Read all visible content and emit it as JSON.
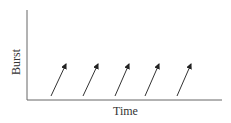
{
  "chart_data": {
    "type": "diagram",
    "title": "",
    "xlabel": "Time",
    "ylabel": "Burst",
    "grid": false,
    "elements": "Five identical upward-slanting arrows evenly spaced along the time axis, representing periodic bursts",
    "arrows": [
      {
        "x1": 51,
        "y1": 96,
        "x2": 66,
        "y2": 64
      },
      {
        "x1": 83,
        "y1": 96,
        "x2": 98,
        "y2": 64
      },
      {
        "x1": 115,
        "y1": 96,
        "x2": 129,
        "y2": 64
      },
      {
        "x1": 145,
        "y1": 96,
        "x2": 159,
        "y2": 64
      },
      {
        "x1": 177,
        "y1": 96,
        "x2": 191,
        "y2": 64
      }
    ],
    "color": "#333333"
  },
  "labels": {
    "x_axis": "Time",
    "y_axis": "Burst"
  }
}
